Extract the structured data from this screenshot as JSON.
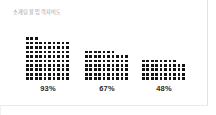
{
  "card": {
    "title": "소개팅율 입력자비도",
    "background": "#ffffff",
    "border_color": "#e3e3e3"
  },
  "chart_data": {
    "type": "waffle",
    "title": "소개팅율 입력자비도",
    "xlabel": "",
    "ylabel": "",
    "unit": "%",
    "grid_columns": 10,
    "grid_rows": 10,
    "dot_color": "#141414",
    "categories": [
      "93%",
      "67%",
      "48%"
    ],
    "values": [
      93,
      67,
      48
    ],
    "series": [
      {
        "name": "93%",
        "value": 93,
        "filled_dots": 93,
        "total_dots": 100,
        "full_rows": 9,
        "partial_row_dots": 3
      },
      {
        "name": "67%",
        "value": 67,
        "filled_dots": 67,
        "total_dots": 100,
        "full_rows": 6,
        "partial_row_dots": 7
      },
      {
        "name": "48%",
        "value": 48,
        "filled_dots": 48,
        "total_dots": 100,
        "full_rows": 4,
        "partial_row_dots": 8
      }
    ],
    "labels": [
      "93%",
      "67%",
      "48%"
    ],
    "ylim": [
      0,
      100
    ],
    "grid": false,
    "legend": "none"
  },
  "groups": [
    {
      "label": "93%",
      "value": 93,
      "left": 26
    },
    {
      "label": "67%",
      "value": 67,
      "left": 85
    },
    {
      "label": "48%",
      "value": 48,
      "left": 142
    }
  ]
}
